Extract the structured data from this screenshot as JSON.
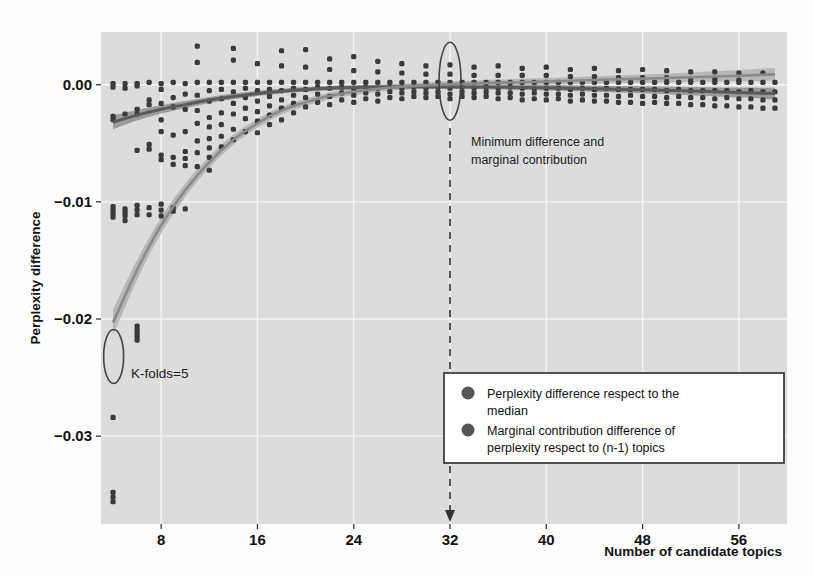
{
  "figure": {
    "background": "#fdfdfd",
    "panel_background": "#dcdcdc",
    "grid_color": "#f5f5f5",
    "point_color": "#3a3a3a",
    "curve_median_color": "#5a5a5a",
    "curve_marginal_color": "#8a8a8a",
    "band_color": "#a8a8a8"
  },
  "axes": {
    "ylabel": "Perplexity difference",
    "xlabel": "Number of candidate topics",
    "yticks": [
      "0.00",
      "-0.01",
      "-0.02",
      "-0.03"
    ],
    "ytick_values": [
      0.0,
      -0.01,
      -0.02,
      -0.03
    ],
    "xticks": [
      "8",
      "16",
      "24",
      "32",
      "40",
      "48",
      "56"
    ],
    "xtick_values": [
      8,
      16,
      24,
      32,
      40,
      48,
      56
    ]
  },
  "annotations": [
    {
      "name": "kfolds",
      "text": "K-folds=5"
    },
    {
      "name": "minimum-difference",
      "line1": "Minimum difference and",
      "line2": "marginal contribution"
    }
  ],
  "legend": {
    "items": [
      {
        "name": "legend-item-median",
        "line1": "Perplexity difference respect to the",
        "line2": "median",
        "color": "#555555"
      },
      {
        "name": "legend-item-marginal",
        "line1": "Marginal contribution difference of",
        "line2": "perplexity respect to (n-1) topics",
        "color": "#555555"
      }
    ]
  },
  "chart_data": {
    "type": "scatter",
    "title": "",
    "xlabel": "Number of candidate topics",
    "ylabel": "Perplexity difference",
    "xlim": [
      3,
      60
    ],
    "ylim": [
      -0.0375,
      0.0045
    ],
    "grid": true,
    "legend_position": "bottom-right",
    "xticks": [
      8,
      16,
      24,
      32,
      40,
      48,
      56
    ],
    "yticks": [
      0.0,
      -0.01,
      -0.02,
      -0.03
    ],
    "vline": {
      "x": 32,
      "style": "dashed",
      "label": "Minimum difference and marginal contribution"
    },
    "series": [
      {
        "name": "Perplexity difference respect to the median",
        "type": "smooth-line-with-band",
        "color": "#5a5a5a",
        "x": [
          4,
          6,
          8,
          10,
          12,
          14,
          16,
          18,
          20,
          22,
          24,
          26,
          28,
          30,
          32,
          36,
          40,
          44,
          48,
          52,
          56,
          59
        ],
        "y": [
          -0.0032,
          -0.0026,
          -0.0021,
          -0.0017,
          -0.0013,
          -0.001,
          -0.00075,
          -0.00055,
          -0.0004,
          -0.0003,
          -0.00024,
          -0.0002,
          -0.00018,
          -0.00017,
          -0.00017,
          -0.0002,
          -0.00026,
          -0.00034,
          -0.00043,
          -0.00054,
          -0.00066,
          -0.00076
        ],
        "band_half_width": [
          0.0006,
          0.00045,
          0.00035,
          0.0003,
          0.00026,
          0.00024,
          0.00022,
          0.00021,
          0.0002,
          0.0002,
          0.0002,
          0.0002,
          0.0002,
          0.0002,
          0.0002,
          0.00021,
          0.00023,
          0.00026,
          0.0003,
          0.00035,
          0.00042,
          0.0005
        ]
      },
      {
        "name": "Marginal contribution difference of perplexity respect to (n-1) topics",
        "type": "smooth-line-with-band",
        "color": "#8a8a8a",
        "x": [
          4,
          6,
          8,
          10,
          12,
          14,
          16,
          18,
          20,
          22,
          24,
          26,
          28,
          30,
          32,
          36,
          40,
          44,
          48,
          52,
          56,
          59
        ],
        "y": [
          -0.0203,
          -0.0158,
          -0.012,
          -0.009,
          -0.0066,
          -0.0047,
          -0.0033,
          -0.0022,
          -0.0015,
          -0.00095,
          -0.0006,
          -0.00035,
          -0.00018,
          -6e-05,
          3e-05,
          0.00017,
          0.00028,
          0.0004,
          0.00052,
          0.00064,
          0.00077,
          0.00088
        ],
        "band_half_width": [
          0.0011,
          0.00085,
          0.00068,
          0.00056,
          0.00048,
          0.00042,
          0.00038,
          0.00034,
          0.00031,
          0.00029,
          0.00028,
          0.00027,
          0.00026,
          0.00026,
          0.00026,
          0.00027,
          0.00029,
          0.00032,
          0.00036,
          0.00041,
          0.00048,
          0.00055
        ]
      }
    ],
    "points_median": [
      [
        4,
        0.0001
      ],
      [
        4,
        -0.0002
      ],
      [
        4,
        -0.0027
      ],
      [
        4,
        -0.003
      ],
      [
        4,
        -0.0104
      ],
      [
        4,
        -0.0107
      ],
      [
        4,
        -0.011
      ],
      [
        4,
        -0.0113
      ],
      [
        4,
        -0.0284
      ],
      [
        4,
        -0.0348
      ],
      [
        4,
        -0.0352
      ],
      [
        4,
        -0.0356
      ],
      [
        5,
        0.0001
      ],
      [
        5,
        -0.0003
      ],
      [
        5,
        -0.0025
      ],
      [
        5,
        -0.0106
      ],
      [
        5,
        -0.0109
      ],
      [
        5,
        -0.0112
      ],
      [
        5,
        -0.0116
      ],
      [
        6,
        0.0001
      ],
      [
        6,
        -0.0001
      ],
      [
        6,
        -0.0021
      ],
      [
        6,
        -0.0025
      ],
      [
        6,
        -0.0056
      ],
      [
        6,
        -0.0103
      ],
      [
        6,
        -0.0107
      ],
      [
        6,
        -0.0111
      ],
      [
        6,
        -0.0206
      ],
      [
        6,
        -0.0209
      ],
      [
        6,
        -0.0212
      ],
      [
        6,
        -0.0215
      ],
      [
        6,
        -0.0218
      ],
      [
        7,
        0.0002
      ],
      [
        7,
        -0.0013
      ],
      [
        7,
        -0.0017
      ],
      [
        7,
        -0.0051
      ],
      [
        7,
        -0.0055
      ],
      [
        7,
        -0.0105
      ],
      [
        7,
        -0.0111
      ],
      [
        8,
        0.0001
      ],
      [
        8,
        -0.0004
      ],
      [
        8,
        -0.0016
      ],
      [
        8,
        -0.003
      ],
      [
        8,
        -0.004
      ],
      [
        8,
        -0.006
      ],
      [
        8,
        -0.0064
      ],
      [
        8,
        -0.0102
      ],
      [
        8,
        -0.0107
      ],
      [
        8,
        -0.0112
      ],
      [
        9,
        0.0002
      ],
      [
        9,
        -0.0011
      ],
      [
        9,
        -0.0019
      ],
      [
        9,
        -0.0043
      ],
      [
        9,
        -0.0062
      ],
      [
        9,
        -0.0068
      ],
      [
        9,
        -0.0105
      ],
      [
        9,
        -0.0108
      ],
      [
        10,
        0.0001
      ],
      [
        10,
        -0.0008
      ],
      [
        10,
        -0.0021
      ],
      [
        10,
        -0.004
      ],
      [
        10,
        -0.0057
      ],
      [
        10,
        -0.0063
      ],
      [
        10,
        -0.0069
      ],
      [
        10,
        -0.0106
      ],
      [
        11,
        0.0033
      ],
      [
        11,
        0.0019
      ],
      [
        11,
        0.0002
      ],
      [
        11,
        -0.0009
      ],
      [
        11,
        -0.0022
      ],
      [
        11,
        -0.0033
      ],
      [
        11,
        -0.0048
      ],
      [
        11,
        -0.0058
      ],
      [
        11,
        -0.007
      ],
      [
        12,
        0.0002
      ],
      [
        12,
        -0.0005
      ],
      [
        12,
        -0.0014
      ],
      [
        12,
        -0.0028
      ],
      [
        12,
        -0.0036
      ],
      [
        12,
        -0.0046
      ],
      [
        12,
        -0.0054
      ],
      [
        12,
        -0.0062
      ],
      [
        12,
        -0.0073
      ],
      [
        13,
        0.0002
      ],
      [
        13,
        -0.0004
      ],
      [
        13,
        -0.0012
      ],
      [
        13,
        -0.0024
      ],
      [
        13,
        -0.0034
      ],
      [
        13,
        -0.0044
      ],
      [
        13,
        -0.0053
      ],
      [
        14,
        0.0031
      ],
      [
        14,
        0.0021
      ],
      [
        14,
        0.0002
      ],
      [
        14,
        -0.0006
      ],
      [
        14,
        -0.0016
      ],
      [
        14,
        -0.0025
      ],
      [
        14,
        -0.0038
      ],
      [
        14,
        -0.0047
      ],
      [
        15,
        0.0002
      ],
      [
        15,
        -0.0003
      ],
      [
        15,
        -0.0011
      ],
      [
        15,
        -0.002
      ],
      [
        15,
        -0.0029
      ],
      [
        15,
        -0.004
      ],
      [
        16,
        0.0018
      ],
      [
        16,
        0.0002
      ],
      [
        16,
        -0.0005
      ],
      [
        16,
        -0.0014
      ],
      [
        16,
        -0.0023
      ],
      [
        16,
        -0.0031
      ],
      [
        16,
        -0.0041
      ],
      [
        17,
        0.0002
      ],
      [
        17,
        -0.0004
      ],
      [
        17,
        -0.001
      ],
      [
        17,
        -0.0018
      ],
      [
        17,
        -0.0026
      ],
      [
        17,
        -0.0034
      ],
      [
        18,
        0.0029
      ],
      [
        18,
        0.0016
      ],
      [
        18,
        0.0002
      ],
      [
        18,
        -0.0005
      ],
      [
        18,
        -0.0013
      ],
      [
        18,
        -0.002
      ],
      [
        18,
        -0.003
      ],
      [
        19,
        0.0002
      ],
      [
        19,
        -0.0003
      ],
      [
        19,
        -0.0009
      ],
      [
        19,
        -0.0016
      ],
      [
        19,
        -0.0024
      ],
      [
        20,
        0.003
      ],
      [
        20,
        0.0015
      ],
      [
        20,
        0.0002
      ],
      [
        20,
        -0.0004
      ],
      [
        20,
        -0.0011
      ],
      [
        20,
        -0.0019
      ],
      [
        21,
        0.0002
      ],
      [
        21,
        -0.0002
      ],
      [
        21,
        -0.0008
      ],
      [
        21,
        -0.0015
      ],
      [
        22,
        0.0022
      ],
      [
        22,
        0.0013
      ],
      [
        22,
        0.0002
      ],
      [
        22,
        -0.0003
      ],
      [
        22,
        -0.001
      ],
      [
        22,
        -0.0017
      ],
      [
        23,
        0.0002
      ],
      [
        23,
        -0.0002
      ],
      [
        23,
        -0.0007
      ],
      [
        23,
        -0.0013
      ],
      [
        24,
        0.0024
      ],
      [
        24,
        0.0012
      ],
      [
        24,
        0.0002
      ],
      [
        24,
        -0.0003
      ],
      [
        24,
        -0.0009
      ],
      [
        24,
        -0.0015
      ],
      [
        25,
        0.0002
      ],
      [
        25,
        -0.0002
      ],
      [
        25,
        -0.0007
      ],
      [
        25,
        -0.0012
      ],
      [
        26,
        0.002
      ],
      [
        26,
        0.0011
      ],
      [
        26,
        0.0002
      ],
      [
        26,
        -0.0003
      ],
      [
        26,
        -0.0008
      ],
      [
        26,
        -0.0014
      ],
      [
        27,
        0.0002
      ],
      [
        27,
        -0.0002
      ],
      [
        27,
        -0.0006
      ],
      [
        27,
        -0.0011
      ],
      [
        28,
        0.0018
      ],
      [
        28,
        0.001
      ],
      [
        28,
        0.0002
      ],
      [
        28,
        -0.0003
      ],
      [
        28,
        -0.0007
      ],
      [
        28,
        -0.0012
      ],
      [
        29,
        0.0002
      ],
      [
        29,
        -0.0002
      ],
      [
        29,
        -0.0006
      ],
      [
        29,
        -0.001
      ],
      [
        30,
        0.0016
      ],
      [
        30,
        0.0009
      ],
      [
        30,
        0.0002
      ],
      [
        30,
        -0.0003
      ],
      [
        30,
        -0.0007
      ],
      [
        30,
        -0.0011
      ],
      [
        31,
        0.0002
      ],
      [
        31,
        -0.0002
      ],
      [
        31,
        -0.0006
      ],
      [
        31,
        -0.001
      ],
      [
        32,
        0.0017
      ],
      [
        32,
        0.0009
      ],
      [
        32,
        0.0002
      ],
      [
        32,
        -0.0003
      ],
      [
        32,
        -0.0008
      ],
      [
        32,
        -0.0012
      ],
      [
        33,
        0.0002
      ],
      [
        33,
        -0.0002
      ],
      [
        33,
        -0.0006
      ],
      [
        33,
        -0.001
      ],
      [
        34,
        0.0015
      ],
      [
        34,
        0.0008
      ],
      [
        34,
        0.0002
      ],
      [
        34,
        -0.0003
      ],
      [
        34,
        -0.0007
      ],
      [
        34,
        -0.0011
      ],
      [
        35,
        0.0002
      ],
      [
        35,
        -0.0002
      ],
      [
        35,
        -0.0006
      ],
      [
        35,
        -0.001
      ],
      [
        36,
        0.0016
      ],
      [
        36,
        0.0008
      ],
      [
        36,
        0.0002
      ],
      [
        36,
        -0.0003
      ],
      [
        36,
        -0.0007
      ],
      [
        36,
        -0.0012
      ],
      [
        37,
        0.0002
      ],
      [
        37,
        -0.0002
      ],
      [
        37,
        -0.0007
      ],
      [
        37,
        -0.0011
      ],
      [
        38,
        0.0014
      ],
      [
        38,
        0.0008
      ],
      [
        38,
        0.0002
      ],
      [
        38,
        -0.0003
      ],
      [
        38,
        -0.0008
      ],
      [
        38,
        -0.0013
      ],
      [
        39,
        0.0002
      ],
      [
        39,
        -0.0003
      ],
      [
        39,
        -0.0007
      ],
      [
        39,
        -0.0012
      ],
      [
        40,
        0.0015
      ],
      [
        40,
        0.0008
      ],
      [
        40,
        0.0002
      ],
      [
        40,
        -0.0003
      ],
      [
        40,
        -0.0008
      ],
      [
        40,
        -0.0013
      ],
      [
        41,
        0.0002
      ],
      [
        41,
        -0.0003
      ],
      [
        41,
        -0.0008
      ],
      [
        41,
        -0.0012
      ],
      [
        42,
        0.0013
      ],
      [
        42,
        0.0007
      ],
      [
        42,
        0.0002
      ],
      [
        42,
        -0.0004
      ],
      [
        42,
        -0.0009
      ],
      [
        42,
        -0.0014
      ],
      [
        43,
        0.0002
      ],
      [
        43,
        -0.0003
      ],
      [
        43,
        -0.0008
      ],
      [
        43,
        -0.0013
      ],
      [
        44,
        0.0014
      ],
      [
        44,
        0.0007
      ],
      [
        44,
        0.0002
      ],
      [
        44,
        -0.0004
      ],
      [
        44,
        -0.0009
      ],
      [
        44,
        -0.0014
      ],
      [
        45,
        0.0002
      ],
      [
        45,
        -0.0003
      ],
      [
        45,
        -0.0009
      ],
      [
        45,
        -0.0014
      ],
      [
        46,
        0.0012
      ],
      [
        46,
        0.0006
      ],
      [
        46,
        0.0002
      ],
      [
        46,
        -0.0004
      ],
      [
        46,
        -0.001
      ],
      [
        46,
        -0.0015
      ],
      [
        47,
        0.0002
      ],
      [
        47,
        -0.0004
      ],
      [
        47,
        -0.0009
      ],
      [
        47,
        -0.0015
      ],
      [
        48,
        0.0013
      ],
      [
        48,
        0.0006
      ],
      [
        48,
        0.0002
      ],
      [
        48,
        -0.0004
      ],
      [
        48,
        -0.001
      ],
      [
        48,
        -0.0016
      ],
      [
        49,
        0.0002
      ],
      [
        49,
        -0.0004
      ],
      [
        49,
        -0.001
      ],
      [
        49,
        -0.0015
      ],
      [
        50,
        0.0012
      ],
      [
        50,
        0.0006
      ],
      [
        50,
        0.0002
      ],
      [
        50,
        -0.0005
      ],
      [
        50,
        -0.0011
      ],
      [
        50,
        -0.0016
      ],
      [
        51,
        0.0002
      ],
      [
        51,
        -0.0004
      ],
      [
        51,
        -0.001
      ],
      [
        51,
        -0.0016
      ],
      [
        52,
        0.0011
      ],
      [
        52,
        0.0005
      ],
      [
        52,
        0.0002
      ],
      [
        52,
        -0.0005
      ],
      [
        52,
        -0.0011
      ],
      [
        52,
        -0.0017
      ],
      [
        53,
        0.0002
      ],
      [
        53,
        -0.0005
      ],
      [
        53,
        -0.0011
      ],
      [
        53,
        -0.0017
      ],
      [
        54,
        0.0011
      ],
      [
        54,
        0.0005
      ],
      [
        54,
        0.0002
      ],
      [
        54,
        -0.0005
      ],
      [
        54,
        -0.0012
      ],
      [
        54,
        -0.0018
      ],
      [
        55,
        0.0002
      ],
      [
        55,
        -0.0005
      ],
      [
        55,
        -0.0011
      ],
      [
        55,
        -0.0018
      ],
      [
        56,
        0.001
      ],
      [
        56,
        0.0004
      ],
      [
        56,
        0.0002
      ],
      [
        56,
        -0.0006
      ],
      [
        56,
        -0.0012
      ],
      [
        56,
        -0.0019
      ],
      [
        57,
        0.0002
      ],
      [
        57,
        -0.0005
      ],
      [
        57,
        -0.0012
      ],
      [
        57,
        -0.0019
      ],
      [
        58,
        0.001
      ],
      [
        58,
        0.0002
      ],
      [
        58,
        -0.0006
      ],
      [
        58,
        -0.0013
      ],
      [
        58,
        -0.002
      ],
      [
        59,
        0.0002
      ],
      [
        59,
        -0.0006
      ],
      [
        59,
        -0.0013
      ],
      [
        59,
        -0.002
      ]
    ]
  }
}
